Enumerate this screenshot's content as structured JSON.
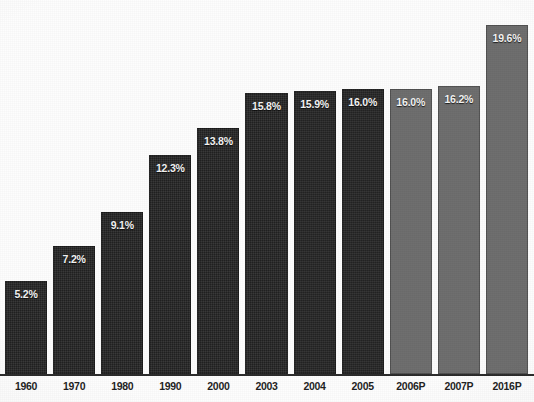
{
  "chart_data": {
    "type": "bar",
    "title": "",
    "subtitle": "",
    "xlabel": "",
    "ylabel": "",
    "ylim": [
      0,
      21
    ],
    "grid": false,
    "legend": "none",
    "value_suffix": "%",
    "categories": [
      "1960",
      "1970",
      "1980",
      "1990",
      "2000",
      "2003",
      "2004",
      "2005",
      "2006P",
      "2007P",
      "2016P"
    ],
    "values": [
      5.2,
      7.2,
      9.1,
      12.3,
      13.8,
      15.8,
      15.9,
      16.0,
      16.0,
      16.2,
      19.6
    ],
    "data_labels": [
      "5.2%",
      "7.2%",
      "9.1%",
      "12.3%",
      "13.8%",
      "15.8%",
      "15.9%",
      "16.0%",
      "16.0%",
      "16.2%",
      "19.6%"
    ],
    "series": [
      {
        "name": "",
        "values": [
          5.2,
          7.2,
          9.1,
          12.3,
          13.8,
          15.8,
          15.9,
          16.0,
          16.0,
          16.2,
          19.6
        ]
      }
    ],
    "point_styles": [
      "actual",
      "actual",
      "actual",
      "actual",
      "actual",
      "actual",
      "actual",
      "actual",
      "projected",
      "projected",
      "projected"
    ]
  },
  "colors": {
    "bar_actual": "#232323",
    "bar_projected": "#6d6d6d",
    "label_text": "#f4f4f4",
    "axis": "#2a2a2a",
    "tick_text": "#1e1e1e",
    "background": "#fdfdfd"
  }
}
